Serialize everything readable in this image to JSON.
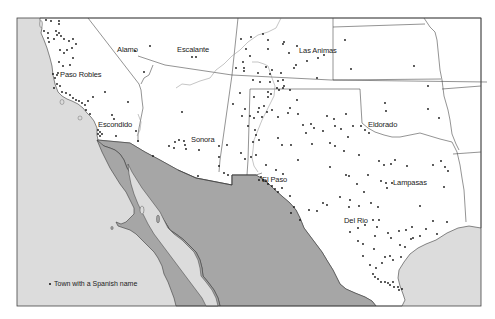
{
  "map": {
    "colors": {
      "ocean": "#dcdcdc",
      "mexico": "#a6a6a6",
      "us_land": "#ffffff",
      "border": "#3a3a3a",
      "river": "#8a8a8a",
      "dot": "#111111"
    },
    "legend": {
      "symbol": "dot",
      "label": "Town with a Spanish name"
    },
    "labels": [
      {
        "id": "alamo",
        "text": "Alamo"
      },
      {
        "id": "escalante",
        "text": "Escalante"
      },
      {
        "id": "las-animas",
        "text": "Las Animas"
      },
      {
        "id": "paso-robles",
        "text": "Paso Robles"
      },
      {
        "id": "escondido",
        "text": "Escondido"
      },
      {
        "id": "sonora",
        "text": "Sonora"
      },
      {
        "id": "eldorado",
        "text": "Eldorado"
      },
      {
        "id": "el-paso",
        "text": "El Paso"
      },
      {
        "id": "lampasas",
        "text": "Lampasas"
      },
      {
        "id": "del-rio",
        "text": "Del Rio"
      }
    ]
  }
}
